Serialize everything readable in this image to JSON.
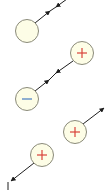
{
  "diagram": {
    "type": "charge-field-diagram",
    "colors": {
      "circle_fill": "#fdfde6",
      "circle_stroke": "#8a8a7a",
      "plus_color": "#d9423a",
      "minus_color": "#6a94c8",
      "line_color": "#1e1e1e"
    },
    "nodes": [
      {
        "id": "n1",
        "symbol": "",
        "cx": 27,
        "cy": 31,
        "r": 11.5
      },
      {
        "id": "n2",
        "symbol": "+",
        "cx": 82,
        "cy": 53,
        "r": 11.5
      },
      {
        "id": "n3",
        "symbol": "−",
        "cx": 27,
        "cy": 99,
        "r": 11.5
      },
      {
        "id": "n4",
        "symbol": "+",
        "cx": 75,
        "cy": 132,
        "r": 11.5
      },
      {
        "id": "n5",
        "symbol": "+",
        "cx": 42,
        "cy": 155,
        "r": 11.5
      }
    ],
    "edges": [
      {
        "id": "e1",
        "from": "n1",
        "to": "off-top",
        "style": "converging-double-arrow"
      },
      {
        "id": "e2",
        "from": "n2",
        "to": "n3",
        "style": "converging-double-arrow"
      },
      {
        "id": "e3",
        "from": "n4",
        "to": "off-right",
        "style": "arrow-out"
      },
      {
        "id": "e4",
        "from": "n5",
        "to": "off-bottom-left",
        "style": "arrow-out"
      }
    ]
  }
}
